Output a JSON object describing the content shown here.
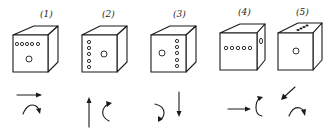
{
  "diagram": {
    "title": "",
    "stroke_color": "#1a1a1a",
    "background": "#ffffff",
    "cubes": [
      {
        "label": "(1)",
        "front_dots": "row of 5 small circles near top + 1 large circle center",
        "motions": [
          "translate-right",
          "rotate-clockwise-over-top"
        ]
      },
      {
        "label": "(2)",
        "front_dots": "column of 5 small circles on left + 1 large circle center",
        "motions": [
          "translate-up",
          "rotate-counterclockwise-c"
        ]
      },
      {
        "label": "(3)",
        "front_dots": "1 large circle left + column of 5 small circles right",
        "motions": [
          "rotate-clockwise-down",
          "translate-down"
        ]
      },
      {
        "label": "(4)",
        "front_dots": "row of 5 small circles center; oval on right face",
        "motions": [
          "translate-right",
          "rotate-c-upward"
        ]
      },
      {
        "label": "(5)",
        "front_dots": "1 large circle center; dots on top face",
        "motions": [
          "translate-down-left",
          "rotate-clockwise-over-top"
        ]
      }
    ]
  }
}
